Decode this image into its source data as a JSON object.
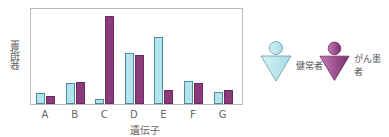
{
  "chart_data": {
    "type": "bar",
    "title": "",
    "xlabel": "遺伝子",
    "ylabel": "発現量",
    "categories": [
      "A",
      "B",
      "C",
      "D",
      "E",
      "F",
      "G"
    ],
    "series": [
      {
        "name": "健常者",
        "color": "#b3e3ec",
        "values": [
          11,
          21,
          5,
          50,
          66,
          23,
          12
        ]
      },
      {
        "name": "がん患者",
        "color": "#8b3a7e",
        "values": [
          8,
          22,
          87,
          48,
          14,
          21,
          14
        ]
      }
    ],
    "ylim": [
      0,
      95
    ],
    "grid": false,
    "legend_position": "right",
    "y_ticks_shown": false
  },
  "legend": {
    "healthy_label": "健常者",
    "cancer_label": "がん患者"
  },
  "axes": {
    "xlabel": "遺伝子",
    "ylabel": "発現量"
  }
}
